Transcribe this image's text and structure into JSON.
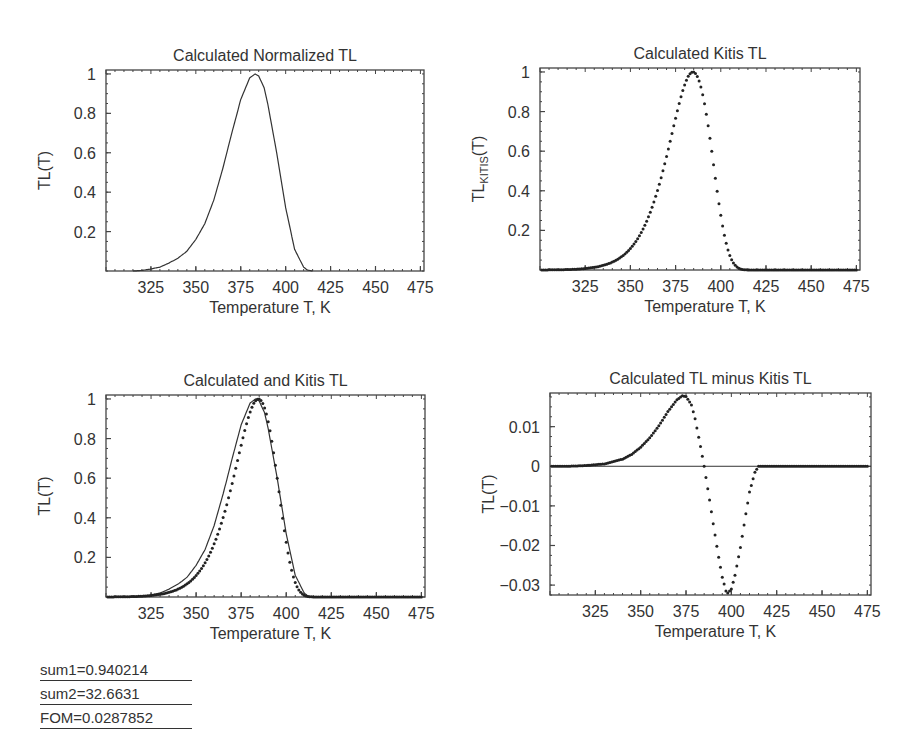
{
  "chart_data": [
    {
      "id": "tl",
      "type": "line",
      "title": "Calculated Normalized TL",
      "xlabel": "Temperature  T, K",
      "ylabel": "TL(T)",
      "xlim": [
        300,
        477
      ],
      "ylim": [
        0,
        1.02
      ],
      "xticks": [
        325,
        350,
        375,
        400,
        425,
        450,
        475
      ],
      "yticks": [
        0.2,
        0.4,
        0.6,
        0.8,
        1
      ],
      "ytick_labels": [
        "0.2",
        "0.4",
        "0.6",
        "0.8",
        "1"
      ],
      "series": [
        {
          "name": "Calculated TL",
          "style": "line",
          "x": [
            315,
            320,
            325,
            330,
            335,
            340,
            345,
            350,
            355,
            360,
            365,
            370,
            375,
            380,
            383,
            385,
            388,
            390,
            395,
            400,
            405,
            410,
            412,
            415
          ],
          "y": [
            0.0,
            0.003,
            0.01,
            0.02,
            0.04,
            0.065,
            0.1,
            0.16,
            0.24,
            0.36,
            0.52,
            0.7,
            0.87,
            0.98,
            1.0,
            0.99,
            0.93,
            0.85,
            0.6,
            0.32,
            0.11,
            0.02,
            0.005,
            0.0
          ]
        }
      ],
      "frame": {
        "left": 106,
        "top": 70,
        "right": 424,
        "bottom": 271
      }
    },
    {
      "id": "kitis",
      "type": "scatter",
      "title": "Calculated Kitis TL",
      "xlabel": "Temperature  T, K",
      "ylabel": "TL_KITIS(T)",
      "xlim": [
        300,
        477
      ],
      "ylim": [
        0,
        1.02
      ],
      "xticks": [
        325,
        350,
        375,
        400,
        425,
        450,
        475
      ],
      "yticks": [
        0.2,
        0.4,
        0.6,
        0.8,
        1
      ],
      "ytick_labels": [
        "0.2",
        "0.4",
        "0.6",
        "0.8",
        "1"
      ],
      "series": [
        {
          "name": "Kitis TL",
          "style": "dots",
          "func": "kitis",
          "xmin": 301,
          "xmax": 475,
          "step": 1
        }
      ],
      "frame": {
        "left": 540,
        "top": 68,
        "right": 860,
        "bottom": 270
      }
    },
    {
      "id": "both",
      "type": "line",
      "title": "Calculated and Kitis TL",
      "xlabel": "Temperature  T, K",
      "ylabel": "TL(T)",
      "xlim": [
        300,
        477
      ],
      "ylim": [
        0,
        1.02
      ],
      "xticks": [
        325,
        350,
        375,
        400,
        425,
        450,
        475
      ],
      "yticks": [
        0.2,
        0.4,
        0.6,
        0.8,
        1
      ],
      "ytick_labels": [
        "0.2",
        "0.4",
        "0.6",
        "0.8",
        "1"
      ],
      "series": [
        {
          "name": "Calculated TL",
          "style": "line",
          "ref": "tl"
        },
        {
          "name": "Kitis TL",
          "style": "dots",
          "func": "kitis",
          "xmin": 301,
          "xmax": 475,
          "step": 1
        }
      ],
      "frame": {
        "left": 106,
        "top": 395,
        "right": 425,
        "bottom": 597
      }
    },
    {
      "id": "diff",
      "type": "scatter",
      "title": "Calculated TL minus Kitis TL",
      "xlabel": "Temperature  T, K",
      "ylabel": "TL(T)",
      "xlim": [
        300,
        477
      ],
      "ylim": [
        -0.0325,
        0.0185
      ],
      "xticks": [
        325,
        350,
        375,
        400,
        425,
        450,
        475
      ],
      "yticks": [
        0.01,
        0,
        -0.01,
        -0.02,
        -0.03
      ],
      "ytick_labels": [
        "0.01",
        "0",
        "−0.01",
        "−0.02",
        "−0.03"
      ],
      "zero_line": true,
      "series": [
        {
          "name": "Difference",
          "style": "dots",
          "x": [
            301,
            310,
            320,
            330,
            340,
            345,
            350,
            355,
            360,
            365,
            370,
            373,
            375,
            378,
            380,
            383,
            385,
            388,
            390,
            393,
            395,
            397,
            398,
            400,
            402,
            405,
            408,
            410,
            413,
            415,
            420,
            430,
            440,
            450,
            460,
            470,
            475
          ],
          "y": [
            0,
            0,
            0.0002,
            0.0006,
            0.0018,
            0.003,
            0.0048,
            0.0072,
            0.0102,
            0.0138,
            0.0168,
            0.0178,
            0.0176,
            0.0155,
            0.012,
            0.005,
            0.0,
            -0.0085,
            -0.0145,
            -0.023,
            -0.028,
            -0.0315,
            -0.032,
            -0.031,
            -0.0275,
            -0.0205,
            -0.012,
            -0.0065,
            -0.0015,
            0.0,
            0,
            0,
            0,
            0,
            0,
            0,
            0
          ]
        }
      ],
      "frame": {
        "left": 550,
        "top": 393,
        "right": 871,
        "bottom": 595
      }
    }
  ],
  "stats": {
    "sum1": "sum1=0.940214",
    "sum2": "sum2=32.6631",
    "fom": "FOM=0.0287852"
  }
}
